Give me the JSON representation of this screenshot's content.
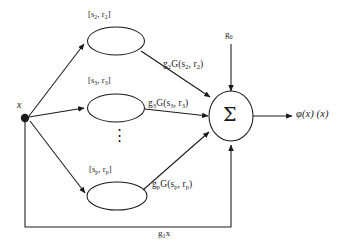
{
  "figure": {
    "type": "block-diagram",
    "background_color": "#ffffff",
    "stroke_color": "#1a1a1a"
  },
  "input": {
    "label": "x",
    "node_name": "input-node"
  },
  "output": {
    "label": "φ(x) (x)"
  },
  "bias": {
    "label": "g",
    "sub": "0"
  },
  "sum_node": {
    "symbol": "Σ"
  },
  "ellipsis": {
    "symbol": "⋮"
  },
  "units": [
    {
      "bracket_prefix": "[s",
      "bracket_sub1": "2",
      "bracket_mid": ", r",
      "bracket_sub2": "2",
      "bracket_suffix": "]",
      "edge_g": "g",
      "edge_g_sub": "2",
      "edge_mid": "G(s",
      "edge_sub1": "2",
      "edge_mid2": ", r",
      "edge_sub2": "2",
      "edge_suffix": ")"
    },
    {
      "bracket_prefix": "[s",
      "bracket_sub1": "3",
      "bracket_mid": ", r",
      "bracket_sub2": "3",
      "bracket_suffix": "]",
      "edge_g": "g",
      "edge_g_sub": "3",
      "edge_mid": "G(s",
      "edge_sub1": "3",
      "edge_mid2": ", r",
      "edge_sub2": "3",
      "edge_suffix": ")"
    },
    {
      "bracket_prefix": "[s",
      "bracket_sub1": "p",
      "bracket_mid": ", r",
      "bracket_sub2": "p",
      "bracket_suffix": "]",
      "edge_g": "g",
      "edge_g_sub": "p",
      "edge_mid": "G(s",
      "edge_sub1": "p",
      "edge_mid2": ", r",
      "edge_sub2": "p",
      "edge_suffix": ")"
    }
  ],
  "feedback": {
    "g": "g",
    "g_sub": "1",
    "var": "x"
  }
}
